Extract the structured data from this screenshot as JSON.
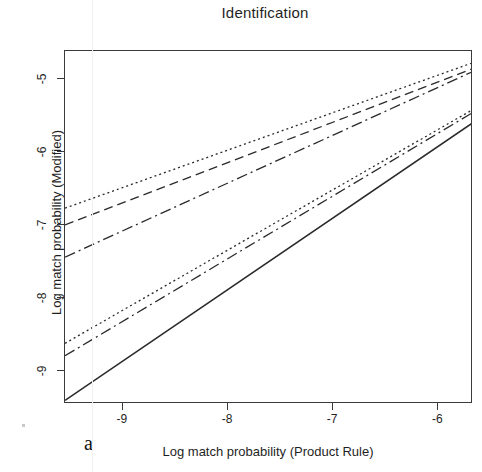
{
  "figure": {
    "panel_letter": "a",
    "background": "#ffffff",
    "ink_color": "#2a2a2a"
  },
  "chart_data": {
    "type": "line",
    "title": "Identification",
    "xlabel": "Log match probability (Product Rule)",
    "ylabel": "Log match probability (Modified)",
    "xlim": [
      -9.55,
      -5.67
    ],
    "ylim": [
      -9.45,
      -4.62
    ],
    "xticks": [
      -9,
      -8,
      -7,
      -6
    ],
    "xticklabels": [
      "-9",
      "-8",
      "-7",
      "-6"
    ],
    "yticks": [
      -5,
      -6,
      -7,
      -8,
      -9
    ],
    "yticklabels": [
      "-5",
      "-6",
      "-7",
      "-8",
      "-9"
    ],
    "grid": false,
    "legend": "none",
    "x": [
      -9.55,
      -5.67
    ],
    "series": [
      {
        "name": "series-1-dotted-upper",
        "style": "dotted",
        "values": [
          -6.77,
          -4.78
        ],
        "slope": 0.513,
        "dasharray": "2,3"
      },
      {
        "name": "series-2-dashed-upper",
        "style": "dashed",
        "values": [
          -7.0,
          -4.86
        ],
        "slope": 0.552,
        "dasharray": "9,5"
      },
      {
        "name": "series-3-dashdot-upper",
        "style": "dash-dot",
        "values": [
          -7.44,
          -4.9
        ],
        "slope": 0.655,
        "dasharray": "11,4,2,4"
      },
      {
        "name": "series-4-dotted-lower",
        "style": "dotted",
        "values": [
          -8.62,
          -5.42
        ],
        "slope": 0.825,
        "dasharray": "2,3"
      },
      {
        "name": "series-5-dashdot-lower",
        "style": "dash-dot",
        "values": [
          -8.79,
          -5.46
        ],
        "slope": 0.859,
        "dasharray": "11,4,2,4"
      },
      {
        "name": "series-6-solid",
        "style": "solid",
        "values": [
          -9.4,
          -5.6
        ],
        "slope": 0.98,
        "dasharray": "none"
      }
    ]
  }
}
